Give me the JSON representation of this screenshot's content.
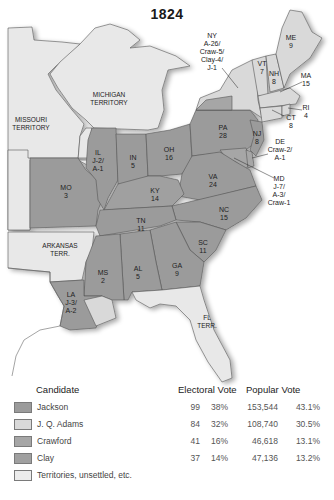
{
  "title": "1824",
  "colors": {
    "jackson": "#9b9b9b",
    "adams": "#d9d9d9",
    "crawford": "#a6a6a6",
    "clay": "#a0a0a0",
    "territory": "#e8e8e8",
    "water": "#ffffff",
    "border": "#555555"
  },
  "map": {
    "territories": [
      {
        "name": "MISSOURI",
        "sub": "TERRITORY"
      },
      {
        "name": "MICHIGAN",
        "sub": "TERRITORY"
      },
      {
        "name": "ARKANSAS",
        "sub": "TERR."
      },
      {
        "name": "FL",
        "sub": "TERR."
      }
    ],
    "states": [
      {
        "abbr": "ME",
        "result": "9"
      },
      {
        "abbr": "VT",
        "result": "7"
      },
      {
        "abbr": "NH",
        "result": "8"
      },
      {
        "abbr": "MA",
        "result": "15"
      },
      {
        "abbr": "RI",
        "result": "4"
      },
      {
        "abbr": "CT",
        "result": "8"
      },
      {
        "abbr": "NY",
        "result": [
          "A-26/",
          "Craw-5/",
          "Clay-4/",
          "J-1"
        ]
      },
      {
        "abbr": "NJ",
        "result": "8"
      },
      {
        "abbr": "DE",
        "result": [
          "Craw-2/",
          "A-1"
        ]
      },
      {
        "abbr": "MD",
        "result": [
          "J-7/",
          "A-3/",
          "Craw-1"
        ]
      },
      {
        "abbr": "PA",
        "result": "28"
      },
      {
        "abbr": "OH",
        "result": "16"
      },
      {
        "abbr": "IN",
        "result": "5"
      },
      {
        "abbr": "IL",
        "result": [
          "J-2/",
          "A-1"
        ]
      },
      {
        "abbr": "MO",
        "result": "3"
      },
      {
        "abbr": "KY",
        "result": "14"
      },
      {
        "abbr": "VA",
        "result": "24"
      },
      {
        "abbr": "NC",
        "result": "15"
      },
      {
        "abbr": "TN",
        "result": "11"
      },
      {
        "abbr": "SC",
        "result": "11"
      },
      {
        "abbr": "GA",
        "result": "9"
      },
      {
        "abbr": "AL",
        "result": "5"
      },
      {
        "abbr": "MS",
        "result": "2"
      },
      {
        "abbr": "LA",
        "result": [
          "J-3/",
          "A-2"
        ]
      }
    ]
  },
  "legend": {
    "headers": {
      "candidate": "Candidate",
      "electoral": "Electoral Vote",
      "popular": "Popular Vote"
    },
    "rows": [
      {
        "candidate": "Jackson",
        "ev": "99",
        "ev_pct": "38%",
        "pv": "153,544",
        "pv_pct": "43.1%",
        "color": "#9b9b9b"
      },
      {
        "candidate": "J. Q. Adams",
        "ev": "84",
        "ev_pct": "32%",
        "pv": "108,740",
        "pv_pct": "30.5%",
        "color": "#d9d9d9"
      },
      {
        "candidate": "Crawford",
        "ev": "41",
        "ev_pct": "16%",
        "pv": "46,618",
        "pv_pct": "13.1%",
        "color": "#a6a6a6"
      },
      {
        "candidate": "Clay",
        "ev": "37",
        "ev_pct": "14%",
        "pv": "47,136",
        "pv_pct": "13.2%",
        "color": "#a0a0a0"
      },
      {
        "candidate": "Territories, unsettled, etc.",
        "ev": "",
        "ev_pct": "",
        "pv": "",
        "pv_pct": "",
        "color": "#ececec"
      }
    ]
  }
}
